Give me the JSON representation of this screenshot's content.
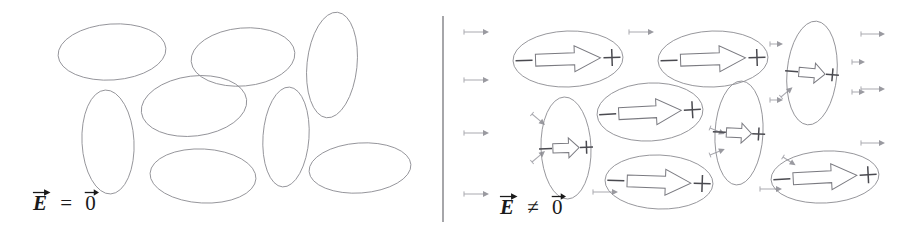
{
  "figure": {
    "type": "diagram",
    "width": 908,
    "height": 240,
    "background_color": "#ffffff",
    "outline_color": "#8d8d93",
    "arrow_color": "#7a7a80",
    "field_arrow_color": "#a9a9af",
    "sign_color": "#4a4a50",
    "divider_color": "#5d5d63"
  },
  "divider": {
    "name": "panel-divider",
    "x": 443,
    "y1": 16,
    "y2": 222
  },
  "panels": [
    {
      "id": "left",
      "label": {
        "field_symbol": "E",
        "relation": "=",
        "zero_symbol": "0",
        "plain": "E⃗ = 0⃗",
        "description": "no applied field"
      },
      "molecules": [
        {
          "cx": 112,
          "cy": 52,
          "rx": 54,
          "ry": 28,
          "rot": -4
        },
        {
          "cx": 243,
          "cy": 57,
          "rx": 52,
          "ry": 29,
          "rot": -5
        },
        {
          "cx": 332,
          "cy": 65,
          "rx": 25,
          "ry": 53,
          "rot": 6
        },
        {
          "cx": 194,
          "cy": 106,
          "rx": 53,
          "ry": 30,
          "rot": -7
        },
        {
          "cx": 108,
          "cy": 142,
          "rx": 26,
          "ry": 52,
          "rot": -3
        },
        {
          "cx": 286,
          "cy": 137,
          "rx": 23,
          "ry": 50,
          "rot": 4
        },
        {
          "cx": 203,
          "cy": 176,
          "rx": 53,
          "ry": 27,
          "rot": 3
        },
        {
          "cx": 360,
          "cy": 168,
          "rx": 51,
          "ry": 25,
          "rot": -4
        }
      ]
    },
    {
      "id": "right",
      "label": {
        "field_symbol": "E",
        "relation": "≠",
        "zero_symbol": "0",
        "plain": "E⃗ ≠ 0⃗",
        "description": "applied field present"
      },
      "negative_sign": "−",
      "positive_sign": "+",
      "molecules": [
        {
          "cx": 568,
          "cy": 59,
          "rx": 55,
          "ry": 28,
          "rot": -2,
          "kind": "wide",
          "minus": true,
          "plus": true
        },
        {
          "cx": 713,
          "cy": 59,
          "rx": 55,
          "ry": 28,
          "rot": -2,
          "kind": "wide",
          "minus": true,
          "plus": true
        },
        {
          "cx": 812,
          "cy": 73,
          "rx": 25,
          "ry": 52,
          "rot": 5,
          "kind": "narrow",
          "minus": true,
          "plus": true
        },
        {
          "cx": 650,
          "cy": 112,
          "rx": 53,
          "ry": 29,
          "rot": -3,
          "kind": "wide",
          "minus": true,
          "plus": true
        },
        {
          "cx": 566,
          "cy": 148,
          "rx": 25,
          "ry": 51,
          "rot": -2,
          "kind": "narrow",
          "minus": true,
          "plus": true
        },
        {
          "cx": 739,
          "cy": 133,
          "rx": 24,
          "ry": 52,
          "rot": 3,
          "kind": "narrow",
          "minus": true,
          "plus": true
        },
        {
          "cx": 659,
          "cy": 182,
          "rx": 54,
          "ry": 27,
          "rot": 2,
          "kind": "wide",
          "minus": true,
          "plus": true
        },
        {
          "cx": 825,
          "cy": 177,
          "rx": 54,
          "ry": 26,
          "rot": -3,
          "kind": "wide",
          "minus": true,
          "plus": true
        }
      ],
      "field_arrows": [
        {
          "x": 464,
          "y": 32,
          "len": 25
        },
        {
          "x": 464,
          "y": 80,
          "len": 25
        },
        {
          "x": 464,
          "y": 133,
          "len": 25
        },
        {
          "x": 464,
          "y": 194,
          "len": 25
        },
        {
          "x": 629,
          "y": 32,
          "len": 25
        },
        {
          "x": 593,
          "y": 192,
          "len": 25
        },
        {
          "x": 770,
          "y": 44,
          "len": 13
        },
        {
          "x": 770,
          "y": 100,
          "len": 13
        },
        {
          "x": 760,
          "y": 189,
          "len": 22
        },
        {
          "x": 852,
          "y": 62,
          "len": 13
        },
        {
          "x": 852,
          "y": 92,
          "len": 13
        },
        {
          "x": 861,
          "y": 34,
          "len": 24
        },
        {
          "x": 861,
          "y": 89,
          "len": 24
        },
        {
          "x": 861,
          "y": 143,
          "len": 24
        }
      ],
      "oblique_field_arrows": [
        {
          "x": 532,
          "y": 114,
          "len": 17,
          "rot": 40
        },
        {
          "x": 532,
          "y": 162,
          "len": 17,
          "rot": -40
        },
        {
          "x": 710,
          "y": 128,
          "len": 16,
          "rot": 22
        },
        {
          "x": 710,
          "y": 155,
          "len": 16,
          "rot": -22
        },
        {
          "x": 781,
          "y": 97,
          "len": 15,
          "rot": -40
        },
        {
          "x": 783,
          "y": 157,
          "len": 15,
          "rot": 33
        }
      ]
    }
  ]
}
